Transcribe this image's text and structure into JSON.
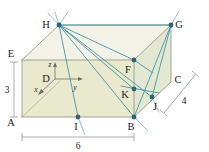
{
  "figure": {
    "canvas": {
      "width": 209,
      "height": 152
    },
    "colors": {
      "face_front": "#e9e9cd",
      "face_top": "#eeeede",
      "face_right": "#e4e8d4",
      "edge_gray": "#8d8d86",
      "edge_dark": "#6f6f64",
      "segment_teal": "#3f8fa6",
      "point_fill": "#2c6478",
      "dimension_gray": "#7b7b74",
      "background": "#ffffff",
      "text": "#1b1b1b"
    }
  },
  "vertices": [
    {
      "id": "A",
      "label": "A",
      "x": 22,
      "y": 117,
      "dot": false,
      "label_dx": -11,
      "label_dy": 9
    },
    {
      "id": "B",
      "label": "B",
      "x": 134,
      "y": 117,
      "dot": true,
      "label_dx": -4,
      "label_dy": 12
    },
    {
      "id": "C",
      "label": "C",
      "x": 171,
      "y": 82,
      "dot": false,
      "label_dx": 6,
      "label_dy": 1
    },
    {
      "id": "D",
      "label": "D",
      "x": 55,
      "y": 79,
      "dot": false,
      "label_dx": -9,
      "label_dy": 3
    },
    {
      "id": "E",
      "label": "E",
      "x": 22,
      "y": 60,
      "dot": false,
      "label_dx": -11,
      "label_dy": -3
    },
    {
      "id": "F",
      "label": "F",
      "x": 134,
      "y": 60,
      "dot": true,
      "label_dx": -4,
      "label_dy": 13
    },
    {
      "id": "G",
      "label": "G",
      "x": 171,
      "y": 25,
      "dot": true,
      "label_dx": 6,
      "label_dy": 2
    },
    {
      "id": "H",
      "label": "H",
      "x": 59,
      "y": 25,
      "dot": true,
      "label_dx": -13,
      "label_dy": 3
    },
    {
      "id": "I",
      "label": "I",
      "x": 78,
      "y": 117,
      "dot": true,
      "label_dx": -2,
      "label_dy": 13
    },
    {
      "id": "J",
      "label": "J",
      "x": 152,
      "y": 97,
      "dot": true,
      "label_dx": 1,
      "label_dy": 13
    },
    {
      "id": "K",
      "label": "K",
      "x": 134,
      "y": 89,
      "dot": true,
      "label_dx": -11,
      "label_dy": 9
    }
  ],
  "axes": {
    "origin_label": "D",
    "origin": {
      "x": 55,
      "y": 79
    },
    "ticks": [
      {
        "name": "z",
        "label": "z",
        "to_x": 55,
        "to_y": 64,
        "label_x": 50,
        "label_y": 66
      },
      {
        "name": "y",
        "label": "y",
        "to_x": 82,
        "to_y": 79,
        "label_x": 75,
        "label_y": 90
      },
      {
        "name": "x",
        "label": "x",
        "to_x": 38,
        "to_y": 94,
        "label_x": 35,
        "label_y": 93
      }
    ]
  },
  "dimensions": [
    {
      "name": "height",
      "label": "3",
      "label_x": 10,
      "label_y": 92,
      "line": {
        "x1": 14,
        "y1": 62,
        "x2": 14,
        "y2": 117
      },
      "orientation": "vertical"
    },
    {
      "name": "width",
      "label": "6",
      "label_x": 78,
      "label_y": 146,
      "line": {
        "x1": 22,
        "y1": 136,
        "x2": 134,
        "y2": 136
      },
      "orientation": "horizontal"
    },
    {
      "name": "depth",
      "label": "4",
      "label_x": 183,
      "label_y": 102,
      "line": {
        "x1": 196,
        "y1": 75,
        "x2": 163,
        "y2": 112
      },
      "orientation": "diagonal"
    }
  ],
  "faces": [
    {
      "name": "front-face",
      "points": "22,60 134,60 134,117 22,117",
      "fill_key": "face_front"
    },
    {
      "name": "top-face",
      "points": "22,60 59,25 171,25 134,60",
      "fill_key": "face_top"
    },
    {
      "name": "right-face",
      "points": "134,60 171,25 171,82 134,117",
      "fill_key": "face_right"
    }
  ],
  "box_edges": [
    {
      "name": "edge-E-F",
      "x1": 22,
      "y1": 60,
      "x2": 134,
      "y2": 60
    },
    {
      "name": "edge-A-B",
      "x1": 22,
      "y1": 117,
      "x2": 134,
      "y2": 117
    },
    {
      "name": "edge-E-A",
      "x1": 22,
      "y1": 60,
      "x2": 22,
      "y2": 117
    },
    {
      "name": "edge-F-B",
      "x1": 134,
      "y1": 60,
      "x2": 134,
      "y2": 117
    },
    {
      "name": "edge-E-H",
      "x1": 22,
      "y1": 60,
      "x2": 59,
      "y2": 25
    },
    {
      "name": "edge-H-G",
      "x1": 59,
      "y1": 25,
      "x2": 171,
      "y2": 25
    },
    {
      "name": "edge-F-G",
      "x1": 134,
      "y1": 60,
      "x2": 171,
      "y2": 25
    },
    {
      "name": "edge-G-C",
      "x1": 171,
      "y1": 25,
      "x2": 171,
      "y2": 82
    },
    {
      "name": "edge-C-B",
      "x1": 171,
      "y1": 82,
      "x2": 134,
      "y2": 117
    },
    {
      "name": "edge-A-D-hidden",
      "x1": 22,
      "y1": 117,
      "x2": 59,
      "y2": 82
    }
  ],
  "segments": [
    {
      "name": "segment-H-B",
      "x1": 59,
      "y1": 25,
      "x2": 134,
      "y2": 117
    },
    {
      "name": "segment-H-I",
      "x1": 59,
      "y1": 25,
      "x2": 78,
      "y2": 117
    },
    {
      "name": "segment-H-K",
      "x1": 59,
      "y1": 25,
      "x2": 134,
      "y2": 89
    },
    {
      "name": "segment-H-J",
      "x1": 59,
      "y1": 25,
      "x2": 152,
      "y2": 97
    },
    {
      "name": "segment-H-F",
      "x1": 59,
      "y1": 25,
      "x2": 134,
      "y2": 60
    },
    {
      "name": "segment-H-G",
      "x1": 59,
      "y1": 25,
      "x2": 171,
      "y2": 25
    },
    {
      "name": "segment-G-J",
      "x1": 171,
      "y1": 25,
      "x2": 152,
      "y2": 97
    },
    {
      "name": "segment-G-B",
      "x1": 171,
      "y1": 25,
      "x2": 134,
      "y2": 117
    },
    {
      "name": "segment-F-ext",
      "x1": 134,
      "y1": 60,
      "x2": 152,
      "y2": 72
    },
    {
      "name": "segment-K-ext",
      "x1": 122,
      "y1": 86,
      "x2": 158,
      "y2": 94
    }
  ],
  "extensions": [
    {
      "name": "ray-through-H-up-left",
      "x1": 49,
      "y1": 14,
      "x2": 59,
      "y2": 25
    },
    {
      "name": "ray-through-H-up-right",
      "x1": 68,
      "y1": 13,
      "x2": 59,
      "y2": 25
    },
    {
      "name": "ray-through-I-down",
      "x1": 78,
      "y1": 117,
      "x2": 84,
      "y2": 134
    },
    {
      "name": "ray-through-B-down",
      "x1": 134,
      "y1": 117,
      "x2": 145,
      "y2": 129
    },
    {
      "name": "ray-through-J-down",
      "x1": 152,
      "y1": 97,
      "x2": 158,
      "y2": 110
    },
    {
      "name": "ray-through-G-up",
      "x1": 171,
      "y1": 25,
      "x2": 178,
      "y2": 12
    }
  ]
}
